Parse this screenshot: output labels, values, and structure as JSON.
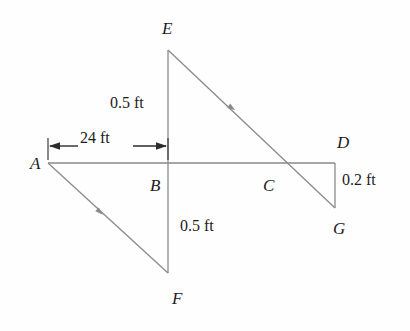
{
  "figure": {
    "stroke_color": "#8a8a8a",
    "text_color": "#1c1c1c",
    "background_color": "#fefefe",
    "joint_labels": [
      {
        "id": "A",
        "text": "A",
        "x": 30,
        "y": 155
      },
      {
        "id": "B",
        "text": "B",
        "x": 150,
        "y": 177
      },
      {
        "id": "C",
        "text": "C",
        "x": 263,
        "y": 177
      },
      {
        "id": "D",
        "text": "D",
        "x": 337,
        "y": 134
      },
      {
        "id": "E",
        "text": "E",
        "x": 162,
        "y": 20
      },
      {
        "id": "F",
        "text": "F",
        "x": 172,
        "y": 290
      },
      {
        "id": "G",
        "text": "G",
        "x": 333,
        "y": 220
      }
    ],
    "dimension_labels": [
      {
        "id": "upper-height",
        "text": "0.5 ft",
        "x": 110,
        "y": 95
      },
      {
        "id": "span",
        "text": "24 ft",
        "x": 80,
        "y": 130
      },
      {
        "id": "lower-height",
        "text": "0.5 ft",
        "x": 180,
        "y": 218
      },
      {
        "id": "right-offset",
        "text": "0.2 ft",
        "x": 342,
        "y": 172
      }
    ],
    "geometry": {
      "points": {
        "A": [
          48,
          163
        ],
        "B": [
          168,
          163
        ],
        "C": [
          285,
          163
        ],
        "D": [
          335,
          163
        ],
        "E": [
          168,
          50
        ],
        "F": [
          168,
          273
        ],
        "G": [
          335,
          208
        ]
      },
      "members": [
        {
          "id": "member-AD",
          "from": "A",
          "to": "D"
        },
        {
          "id": "member-EF",
          "from": "E",
          "to": "F"
        },
        {
          "id": "member-EG",
          "from": "E",
          "to": "G"
        },
        {
          "id": "member-AF",
          "from": "A",
          "to": "F"
        },
        {
          "id": "member-DG",
          "from": "D",
          "to": "G"
        }
      ],
      "midpoint_markers": [
        {
          "id": "marker-EG",
          "x": 232,
          "y": 108,
          "angle": 34
        },
        {
          "id": "marker-AF",
          "x": 100,
          "y": 212,
          "angle": 42
        }
      ]
    },
    "dimension_line": {
      "id": "span-dimension",
      "y": 146,
      "x_start": 48,
      "x_end": 168,
      "extension_top": 138,
      "extension_bottom": 160
    }
  }
}
